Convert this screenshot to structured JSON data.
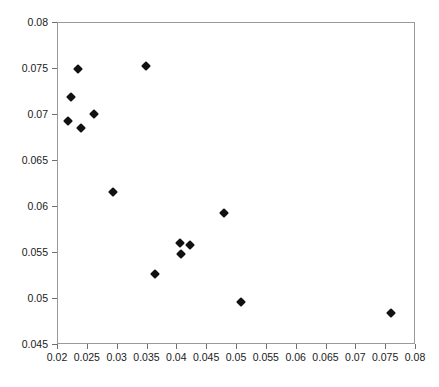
{
  "chart_data": {
    "type": "scatter",
    "title": "",
    "subtitle": "",
    "xlabel": "",
    "ylabel": "",
    "xlim": [
      0.02,
      0.08
    ],
    "ylim": [
      0.045,
      0.08
    ],
    "grid": false,
    "legend": null,
    "marker": "filled-diamond",
    "marker_color": "#111111",
    "frame_color": "#9a9a9a",
    "xticks": [
      0.02,
      0.025,
      0.03,
      0.035,
      0.04,
      0.045,
      0.05,
      0.055,
      0.06,
      0.065,
      0.07,
      0.075,
      0.08
    ],
    "xtick_labels": [
      "0.02",
      "0.025",
      "0.03",
      "0.035",
      "0.04",
      "0.045",
      "0.05",
      "0.055",
      "0.06",
      "0.065",
      "0.07",
      "0.075",
      "0.08"
    ],
    "yticks": [
      0.045,
      0.05,
      0.055,
      0.06,
      0.065,
      0.07,
      0.075,
      0.08
    ],
    "ytick_labels": [
      "0.045",
      "0.05",
      "0.055",
      "0.06",
      "0.065",
      "0.07",
      "0.075",
      "0.08"
    ],
    "series": [
      {
        "name": "series-1",
        "points": [
          {
            "x": 0.0216,
            "y": 0.0694
          },
          {
            "x": 0.0221,
            "y": 0.072
          },
          {
            "x": 0.0234,
            "y": 0.075
          },
          {
            "x": 0.0238,
            "y": 0.0686
          },
          {
            "x": 0.026,
            "y": 0.0701
          },
          {
            "x": 0.0292,
            "y": 0.0616
          },
          {
            "x": 0.0348,
            "y": 0.0753
          },
          {
            "x": 0.0362,
            "y": 0.0527
          },
          {
            "x": 0.0405,
            "y": 0.0561
          },
          {
            "x": 0.0406,
            "y": 0.0549
          },
          {
            "x": 0.0421,
            "y": 0.0559
          },
          {
            "x": 0.0478,
            "y": 0.0593
          },
          {
            "x": 0.0506,
            "y": 0.0497
          },
          {
            "x": 0.0758,
            "y": 0.0485
          }
        ]
      }
    ]
  }
}
